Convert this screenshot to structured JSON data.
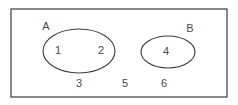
{
  "diagram": {
    "type": "venn",
    "title": "",
    "universe": {
      "name": "universal-set-rectangle",
      "x": 11,
      "y": 9,
      "width": 216,
      "height": 88
    },
    "sets": [
      {
        "id": "A",
        "label": "A",
        "label_x": 46,
        "label_y": 27,
        "cx": 79,
        "cy": 51,
        "rx": 36,
        "ry": 22,
        "members": [
          "1",
          "2"
        ]
      },
      {
        "id": "B",
        "label": "B",
        "label_x": 190,
        "label_y": 29,
        "cx": 168,
        "cy": 52,
        "rx": 27,
        "ry": 16,
        "members": [
          "4"
        ]
      }
    ],
    "elements": [
      {
        "value": "1",
        "x": 58,
        "y": 51,
        "region": "A-only"
      },
      {
        "value": "2",
        "x": 101,
        "y": 51,
        "region": "A-only"
      },
      {
        "value": "4",
        "x": 166,
        "y": 52,
        "region": "B-only"
      },
      {
        "value": "3",
        "x": 79,
        "y": 84,
        "region": "outside"
      },
      {
        "value": "5",
        "x": 125,
        "y": 84,
        "region": "outside"
      },
      {
        "value": "6",
        "x": 164,
        "y": 84,
        "region": "outside"
      }
    ],
    "colors": {
      "stroke": "#3b3b3b",
      "text": "#4a4a4a",
      "background": "#ffffff"
    }
  }
}
